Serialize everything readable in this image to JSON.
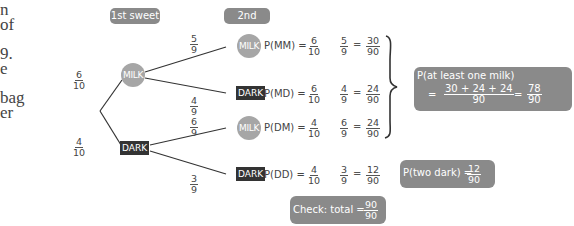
{
  "side_text_fragments": [
    {
      "text": "n",
      "top": 2
    },
    {
      "text": "of",
      "top": 17
    },
    {
      "text": "9.",
      "top": 46
    },
    {
      "text": "e",
      "top": 61
    },
    {
      "text": "bag",
      "top": 90
    },
    {
      "text": "er",
      "top": 105
    }
  ],
  "headers": {
    "first": "1st sweet",
    "second": "2nd sweet"
  },
  "nodes": {
    "first_milk": "MILK",
    "first_dark": "DARK",
    "mm": "MILK",
    "md": "DARK",
    "dm": "MILK",
    "dd": "DARK"
  },
  "branches": {
    "first_milk": {
      "num": "6",
      "den": "10"
    },
    "first_dark": {
      "num": "4",
      "den": "10"
    },
    "mm": {
      "num": "5",
      "den": "9"
    },
    "md": {
      "num": "4",
      "den": "9"
    },
    "dm": {
      "num": "6",
      "den": "9"
    },
    "dd": {
      "num": "3",
      "den": "9"
    }
  },
  "outcomes": [
    {
      "label": "P(MM) =",
      "a": {
        "num": "6",
        "den": "10"
      },
      "b": {
        "num": "5",
        "den": "9"
      },
      "eq": "=",
      "r": {
        "num": "30",
        "den": "90"
      }
    },
    {
      "label": "P(MD) =",
      "a": {
        "num": "6",
        "den": "10"
      },
      "b": {
        "num": "4",
        "den": "9"
      },
      "eq": "=",
      "r": {
        "num": "24",
        "den": "90"
      }
    },
    {
      "label": "P(DM) =",
      "a": {
        "num": "4",
        "den": "10"
      },
      "b": {
        "num": "6",
        "den": "9"
      },
      "eq": "=",
      "r": {
        "num": "24",
        "den": "90"
      }
    },
    {
      "label": "P(DD) =",
      "a": {
        "num": "4",
        "den": "10"
      },
      "b": {
        "num": "3",
        "den": "9"
      },
      "eq": "=",
      "r": {
        "num": "12",
        "den": "90"
      }
    }
  ],
  "at_least_one_milk": {
    "title": "P(at least one milk)",
    "eq1": "=",
    "sum_num": "30 + 24 + 24",
    "sum_den": "90",
    "eq2": "=",
    "result_num": "78",
    "result_den": "90"
  },
  "two_dark": {
    "label": "P(two dark) =",
    "num": "12",
    "den": "90"
  },
  "check": {
    "label": "Check: total =",
    "num": "90",
    "den": "90"
  },
  "colors": {
    "pill": "#8a8a8a",
    "milk_node": "#a6a6a6",
    "dark_node": "#333333",
    "line": "#333333"
  }
}
